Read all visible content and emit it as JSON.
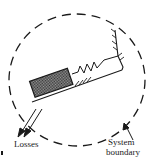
{
  "diagram": {
    "type": "physical system schematic",
    "labels": {
      "losses": "Losses",
      "system_line1": "System",
      "system_line2": "boundary"
    },
    "elements": [
      {
        "name": "system-boundary",
        "shape": "dashed circle"
      },
      {
        "name": "mass-block",
        "shape": "shaded rectangle on incline"
      },
      {
        "name": "spring",
        "shape": "zigzag connecting block to wall"
      },
      {
        "name": "fixed-wall",
        "shape": "hatched vertical support"
      },
      {
        "name": "inclined-surface",
        "shape": "hatched sloped line"
      },
      {
        "name": "losses-arrows",
        "shape": "two arrows pointing out of boundary"
      },
      {
        "name": "boundary-pointer",
        "shape": "leader arrow to dashed circle"
      }
    ],
    "colors": {
      "ink": "#1a1a1a",
      "block_fill": "#6e6e6e",
      "background": "#ffffff"
    }
  }
}
